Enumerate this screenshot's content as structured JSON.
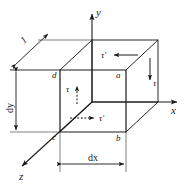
{
  "figure": {
    "background_color": "#ffffff",
    "line_color": "#1a1a1a",
    "axes": [
      {
        "name": "y-axis",
        "label": "y",
        "direction": "up"
      },
      {
        "name": "x-axis",
        "label": "x",
        "direction": "right"
      },
      {
        "name": "z-axis",
        "label": "z",
        "direction": "down-left"
      }
    ],
    "vertices": [
      {
        "name": "vertex-a",
        "label": "a"
      },
      {
        "name": "vertex-b",
        "label": "b"
      },
      {
        "name": "vertex-c",
        "label": "c"
      },
      {
        "name": "vertex-d",
        "label": "d"
      }
    ],
    "dimensions": [
      {
        "name": "depth-dimension",
        "label": "1"
      },
      {
        "name": "height-dimension",
        "label": "dy"
      },
      {
        "name": "width-dimension",
        "label": "dx"
      }
    ],
    "stresses": [
      {
        "name": "stress-top",
        "label": "τ′",
        "arrow": "left",
        "style": "solid"
      },
      {
        "name": "stress-right",
        "label": "τ",
        "arrow": "down",
        "style": "solid"
      },
      {
        "name": "stress-interior-vertical",
        "label": "τ",
        "arrow": "up",
        "style": "dashed"
      },
      {
        "name": "stress-interior-horizontal",
        "label": "τ′",
        "arrow": "right",
        "style": "dashed"
      }
    ]
  }
}
